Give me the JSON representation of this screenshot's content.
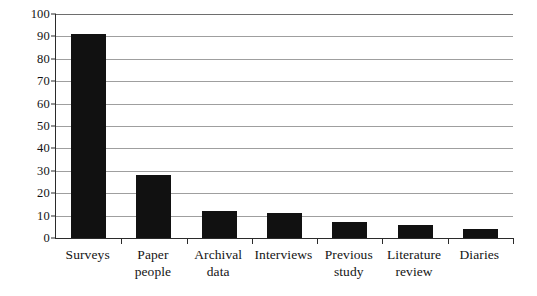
{
  "chart_data": {
    "type": "bar",
    "title": "",
    "subtitle": "",
    "xlabel": "",
    "ylabel": "",
    "categories": [
      "Surveys",
      "Paper people",
      "Archival data",
      "Interviews",
      "Previous study",
      "Literature review",
      "Diaries"
    ],
    "category_lines": [
      [
        "Surveys"
      ],
      [
        "Paper",
        "people"
      ],
      [
        "Archival",
        "data"
      ],
      [
        "Interviews"
      ],
      [
        "Previous",
        "study"
      ],
      [
        "Literature",
        "review"
      ],
      [
        "Diaries"
      ]
    ],
    "values": [
      91,
      28,
      12,
      11,
      7,
      6,
      4
    ],
    "ylim": [
      0,
      100
    ],
    "ytick_values": [
      0,
      10,
      20,
      30,
      40,
      50,
      60,
      70,
      80,
      90,
      100
    ],
    "ytick_labels": [
      "0",
      "10",
      "20",
      "30",
      "40",
      "50",
      "60",
      "70",
      "80",
      "90",
      "100"
    ],
    "grid": true,
    "grid_orientation": "horizontal",
    "legend": false,
    "legend_position": "none",
    "bar_color": "#111111",
    "gridline_color": "#8e8e8e",
    "axis_color": "#2b2b2b",
    "background_color": "#ffffff"
  }
}
